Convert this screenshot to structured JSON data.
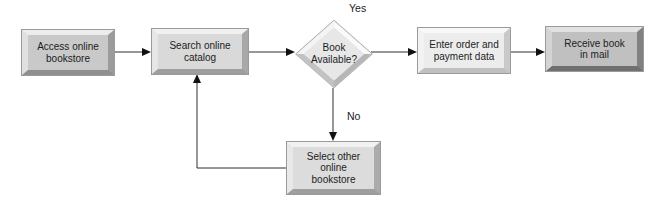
{
  "diagram": {
    "type": "flowchart",
    "background": "#ffffff",
    "line_color": "#2e2e2e",
    "arrow_color": "#111111",
    "text_color": "#1c1c1c",
    "nodes": [
      {
        "id": "access-online-bookstore",
        "shape": "process",
        "label": "Access online\nbookstore",
        "face_color": "#c9c9c9"
      },
      {
        "id": "search-online-catalog",
        "shape": "process",
        "label": "Search online\ncatalog",
        "face_color": "#d9d9d9"
      },
      {
        "id": "book-available",
        "shape": "decision",
        "label": "Book\nAvailable?",
        "face_color": "#e7e7e7"
      },
      {
        "id": "enter-order-and-payment-data",
        "shape": "process",
        "label": "Enter order and\npayment data",
        "face_color": "#ececec"
      },
      {
        "id": "receive-book-in-mail",
        "shape": "process",
        "label": "Receive book\nin mail",
        "face_color": "#c0c0c0"
      },
      {
        "id": "select-other-online-bookstore",
        "shape": "process",
        "label": "Select other\nonline\nbookstore",
        "face_color": "#dcdcdc"
      }
    ],
    "edges": [
      {
        "from": "access-online-bookstore",
        "to": "search-online-catalog",
        "label": ""
      },
      {
        "from": "search-online-catalog",
        "to": "book-available",
        "label": ""
      },
      {
        "from": "book-available",
        "to": "enter-order-and-payment-data",
        "label": "Yes"
      },
      {
        "from": "enter-order-and-payment-data",
        "to": "receive-book-in-mail",
        "label": ""
      },
      {
        "from": "book-available",
        "to": "select-other-online-bookstore",
        "label": "No"
      },
      {
        "from": "select-other-online-bookstore",
        "to": "search-online-catalog",
        "label": ""
      }
    ]
  }
}
